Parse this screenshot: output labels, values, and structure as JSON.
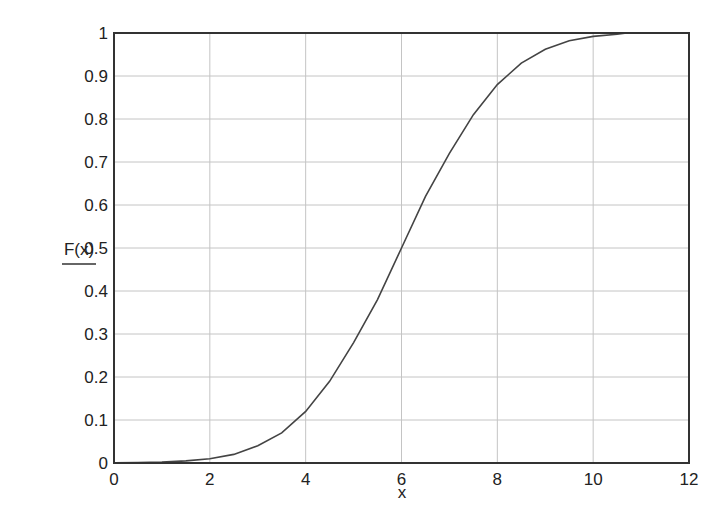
{
  "chart_data": {
    "type": "line",
    "title": "",
    "xlabel": "x",
    "ylabel": "F(x)",
    "xlim": [
      0,
      12
    ],
    "ylim": [
      0,
      1
    ],
    "grid": true,
    "legend": null,
    "x_ticks": [
      "0",
      "2",
      "4",
      "6",
      "8",
      "10",
      "12"
    ],
    "y_ticks": [
      "0",
      "0.1",
      "0.2",
      "0.3",
      "0.4",
      "0.5",
      "0.6",
      "0.7",
      "0.8",
      "0.9",
      "1"
    ],
    "series": [
      {
        "name": "F(x)",
        "color": "#444444",
        "x": [
          0,
          0.5,
          1,
          1.5,
          2,
          2.5,
          3,
          3.5,
          4,
          4.5,
          5,
          5.5,
          6,
          6.5,
          7,
          7.5,
          8,
          8.5,
          9,
          9.5,
          10,
          10.5,
          10.7
        ],
        "y": [
          0.0002,
          0.001,
          0.002,
          0.005,
          0.01,
          0.02,
          0.04,
          0.07,
          0.12,
          0.19,
          0.28,
          0.38,
          0.5,
          0.62,
          0.72,
          0.81,
          0.88,
          0.93,
          0.962,
          0.982,
          0.992,
          0.997,
          1.0
        ]
      }
    ]
  },
  "axes": {
    "xlabel": "x",
    "ylabel": "F(x)"
  }
}
